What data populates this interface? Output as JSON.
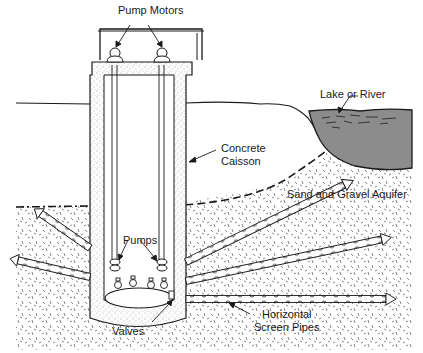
{
  "diagram": {
    "labels": {
      "pump_motors": "Pump Motors",
      "lake_or_river": "Lake or River",
      "concrete_caisson_line1": "Concrete",
      "concrete_caisson_line2": "Caisson",
      "aquifer": "Sand and Gravel Aquifer",
      "pumps": "Pumps",
      "valves": "Valves",
      "screen_pipes_line1": "Horizontal",
      "screen_pipes_line2": "Screen Pipes"
    },
    "colors": {
      "line": "#1a1a1a",
      "water": "#8c8c8c",
      "concrete_speckle": "#9a9a9a",
      "background": "#ffffff"
    }
  }
}
